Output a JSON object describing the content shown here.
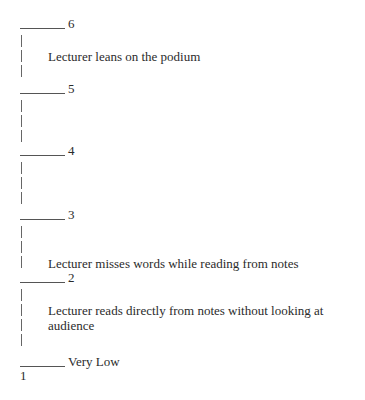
{
  "scale": {
    "levels": [
      {
        "label": "6",
        "description": "Lecturer leans on the podium"
      },
      {
        "label": "5",
        "description": ""
      },
      {
        "label": "4",
        "description": ""
      },
      {
        "label": "3",
        "description": "Lecturer misses words while reading from notes"
      },
      {
        "label": "2",
        "description": "Lecturer reads directly from notes without looking at audience"
      },
      {
        "label": "Very Low",
        "description": ""
      }
    ],
    "bottom_number": "1"
  }
}
